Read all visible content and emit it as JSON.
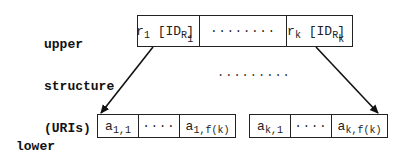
{
  "upper_label": {
    "lines": [
      "upper",
      "structure",
      "(URIs)"
    ]
  },
  "lower_label": {
    "lines": [
      "lower",
      "structure",
      "(field values)"
    ]
  },
  "upper_structure": {
    "first_cell": {
      "var": "r",
      "var_sub": "1",
      "id": "[ID",
      "id_sub": "R",
      "id_subsub": "1",
      "close": "]"
    },
    "middle_cell": "........",
    "last_cell": {
      "var": "r",
      "var_sub": "k",
      "id": "[ID",
      "id_sub": "R",
      "id_subsub": "k",
      "close": "]"
    }
  },
  "middle_ellipsis": ".........",
  "lower_structures": [
    {
      "first_cell": {
        "var": "a",
        "sub": "1,1"
      },
      "middle_cell": "....",
      "last_cell": {
        "var": "a",
        "sub": "1,f(k)"
      }
    },
    {
      "first_cell": {
        "var": "a",
        "sub": "k,1"
      },
      "middle_cell": "....",
      "last_cell": {
        "var": "a",
        "sub": "k,f(k)"
      }
    }
  ],
  "colors": {
    "stroke": "#222222",
    "text": "#111111",
    "background": "#ffffff"
  }
}
